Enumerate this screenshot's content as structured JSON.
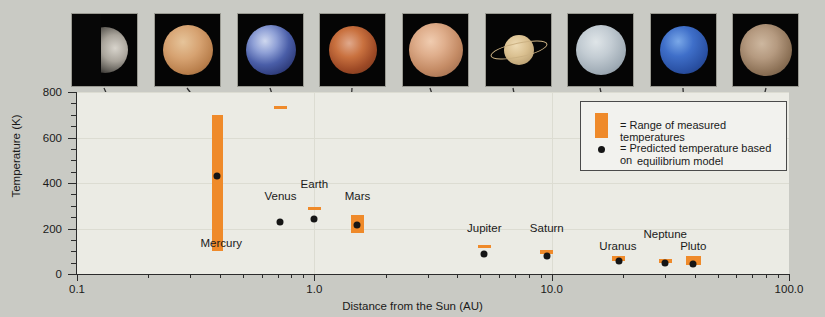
{
  "chart_data": {
    "type": "scatter",
    "title": "",
    "xlabel": "Distance from the Sun (AU)",
    "ylabel": "Temperature (K)",
    "xscale": "log",
    "xlim": [
      0.1,
      100.0
    ],
    "ylim": [
      0,
      800
    ],
    "x_tick_labels": [
      "0.1",
      "1.0",
      "10.0",
      "100.0"
    ],
    "x_tick_values": [
      0.1,
      1.0,
      10.0,
      100.0
    ],
    "y_tick_labels": [
      "0",
      "200",
      "400",
      "600",
      "800"
    ],
    "y_tick_values": [
      0,
      200,
      400,
      600,
      800
    ],
    "y_minor_step": 50,
    "grid": "horizontal",
    "legend_position": "upper-right-inside",
    "series": [
      {
        "name": "Range of measured temperatures",
        "type": "range-bar",
        "color": "#ef8a2a"
      },
      {
        "name": "Predicted temperature based on equilibrium model",
        "type": "point",
        "color": "#151515"
      }
    ],
    "points": [
      {
        "label": "Mercury",
        "distance_au": 0.39,
        "predicted_k": 430,
        "measured_min_k": 100,
        "measured_max_k": 700
      },
      {
        "label": "Venus",
        "distance_au": 0.72,
        "predicted_k": 230,
        "measured_min_k": 725,
        "measured_max_k": 740
      },
      {
        "label": "Earth",
        "distance_au": 1.0,
        "predicted_k": 240,
        "measured_min_k": 280,
        "measured_max_k": 295
      },
      {
        "label": "Mars",
        "distance_au": 1.52,
        "predicted_k": 215,
        "measured_min_k": 180,
        "measured_max_k": 260
      },
      {
        "label": "Jupiter",
        "distance_au": 5.2,
        "predicted_k": 90,
        "measured_min_k": 120,
        "measured_max_k": 128
      },
      {
        "label": "Saturn",
        "distance_au": 9.54,
        "predicted_k": 80,
        "measured_min_k": 95,
        "measured_max_k": 105
      },
      {
        "label": "Uranus",
        "distance_au": 19.2,
        "predicted_k": 58,
        "measured_min_k": 55,
        "measured_max_k": 78
      },
      {
        "label": "Neptune",
        "distance_au": 30.1,
        "predicted_k": 50,
        "measured_min_k": 55,
        "measured_max_k": 65
      },
      {
        "label": "Pluto",
        "distance_au": 39.5,
        "predicted_k": 42,
        "measured_min_k": 40,
        "measured_max_k": 80
      }
    ]
  },
  "legend": {
    "range_label": "= Range of measured temperatures",
    "predicted_label_line1": "= Predicted temperature based on",
    "predicted_label_line2": "equilibrium model"
  },
  "thumbnails": [
    {
      "name": "mercury-thumbnail",
      "label": "Mercury"
    },
    {
      "name": "venus-thumbnail",
      "label": "Venus"
    },
    {
      "name": "earth-thumbnail",
      "label": "Earth"
    },
    {
      "name": "mars-thumbnail",
      "label": "Mars"
    },
    {
      "name": "jupiter-thumbnail",
      "label": "Jupiter"
    },
    {
      "name": "saturn-thumbnail",
      "label": "Saturn"
    },
    {
      "name": "uranus-thumbnail",
      "label": "Uranus"
    },
    {
      "name": "neptune-thumbnail",
      "label": "Neptune"
    },
    {
      "name": "pluto-thumbnail",
      "label": "Pluto"
    }
  ],
  "colors": {
    "measured_orange": "#ef8a2a",
    "predicted_black": "#151515",
    "plot_background": "#ebebe4",
    "page_background": "#c9cac4"
  }
}
